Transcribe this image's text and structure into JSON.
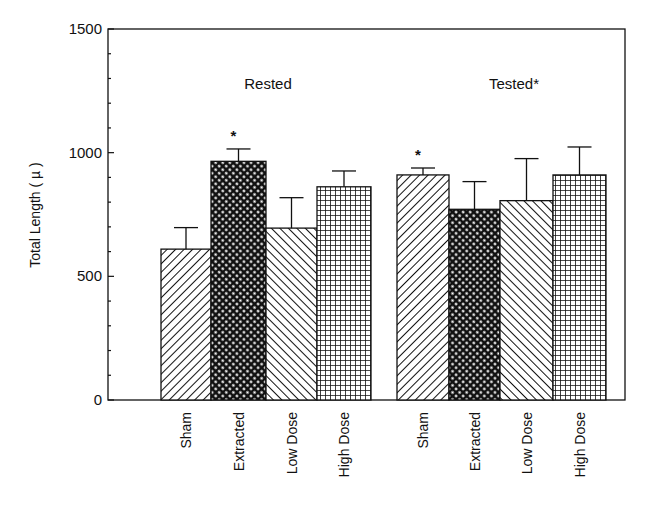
{
  "chart_data": {
    "type": "bar",
    "title": "",
    "xlabel": "",
    "ylabel": "Total Length ( µ )",
    "ylim": [
      0,
      1500
    ],
    "yticks": [
      0,
      500,
      1000,
      1500
    ],
    "y_minor_tick_step": 100,
    "grid": false,
    "groups": [
      {
        "name": "Rested",
        "label": "Rested",
        "categories": [
          "Sham",
          "Extracted",
          "Low Dose",
          "High Dose"
        ],
        "values": [
          610,
          965,
          695,
          862
        ],
        "error_upper": [
          697,
          1015,
          818,
          926
        ],
        "significance": [
          false,
          true,
          false,
          false
        ]
      },
      {
        "name": "Tested",
        "label": "Tested*",
        "categories": [
          "Sham",
          "Extracted",
          "Low Dose",
          "High Dose"
        ],
        "values": [
          910,
          771,
          806,
          910
        ],
        "error_upper": [
          938,
          883,
          976,
          1023
        ],
        "significance": [
          true,
          false,
          false,
          false
        ]
      }
    ],
    "patterns": {
      "Sham": "diagonal-right",
      "Extracted": "dense-crosshatch",
      "Low Dose": "diagonal-left",
      "High Dose": "grid"
    },
    "significance_marker": "*"
  },
  "colors": {
    "ink": "#111111",
    "background": "#ffffff"
  }
}
